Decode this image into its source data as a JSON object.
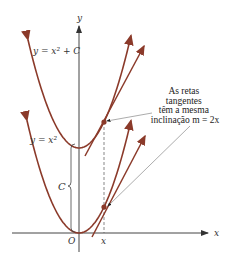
{
  "diagram": {
    "axes": {
      "x_label": "x",
      "y_label": "y",
      "origin_label": "O",
      "x_tick_label": "x"
    },
    "curves": [
      {
        "name": "parabola-shifted",
        "equation_label": "y = x² + C"
      },
      {
        "name": "parabola-base",
        "equation_label": "y = x²"
      }
    ],
    "offset_label": "C",
    "annotation": {
      "lines": [
        "As retas",
        "tangentes",
        "têm a mesma",
        "inclinação m = 2x"
      ]
    },
    "colors": {
      "curve": "#8b3a2a",
      "axis": "#444444",
      "pointer": "#888888"
    }
  }
}
